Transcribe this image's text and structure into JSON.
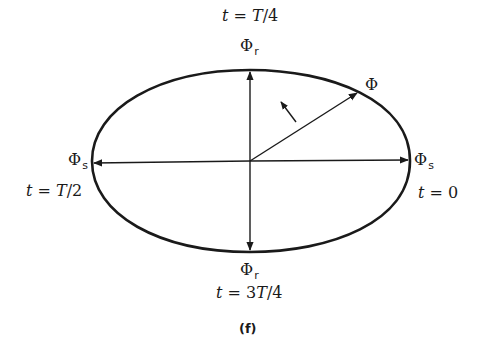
{
  "figure": {
    "caption": "(f)",
    "stroke_color": "#1a1a1a",
    "background": "#ffffff"
  },
  "labels": {
    "top_time": {
      "t": "t",
      "eq": " = ",
      "val": "T",
      "rest": "/4"
    },
    "top_phi": {
      "sym": "Φ",
      "sub": "r"
    },
    "bottom_phi": {
      "sym": "Φ",
      "sub": "r"
    },
    "bottom_time": {
      "t": "t",
      "eq": " = 3",
      "val": "T",
      "rest": "/4"
    },
    "left_phi": {
      "sym": "Φ",
      "sub": "s"
    },
    "left_time": {
      "t": "t",
      "eq": " = ",
      "val": "T",
      "rest": "/2"
    },
    "right_phi": {
      "sym": "Φ",
      "sub": "s"
    },
    "right_time": {
      "t": "t",
      "eq": " = 0",
      "val": "",
      "rest": ""
    },
    "rotating_phi": {
      "sym": "Φ"
    }
  },
  "geometry": {
    "center": [
      250,
      161
    ],
    "ellipse": {
      "left": 92,
      "right": 410,
      "top": 70,
      "bottom": 252
    },
    "phi_vector_tip": [
      358,
      92
    ],
    "rotation_arrow": {
      "from": [
        296,
        120
      ],
      "to": [
        280,
        101
      ]
    }
  }
}
